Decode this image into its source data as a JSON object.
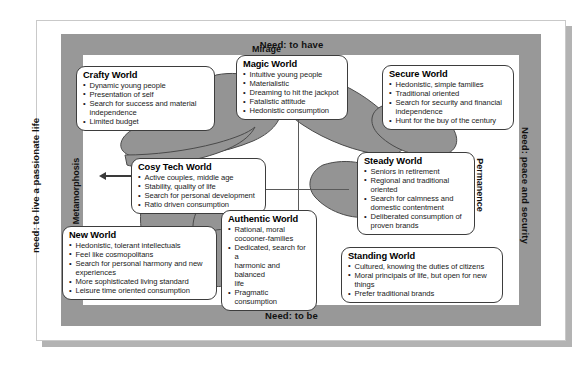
{
  "frame": {
    "need_top": "Need: to have",
    "need_bottom": "Need: to be",
    "need_left": "need: to live a passionate life",
    "need_right": "Need: peace and security"
  },
  "axes": {
    "metamorphosis": "Metamorphosis",
    "permanence": "Permanence",
    "mirage": "Mirage",
    "reality": "Reality"
  },
  "worlds": [
    {
      "id": "crafty",
      "title": "Crafty World",
      "items": [
        "Dynamic young people",
        "Presentation of self",
        "Search for success and material",
        "independence",
        "Limited budget"
      ],
      "continuations": [
        3
      ]
    },
    {
      "id": "magic",
      "title": "Magic World",
      "items": [
        "Intuitive young people",
        "Materialistic",
        "Dreaming to hit the jackpot",
        "Fatalistic attitude",
        "Hedonistic consumption"
      ],
      "continuations": []
    },
    {
      "id": "secure",
      "title": "Secure World",
      "items": [
        "Hedonistic, simple families",
        "Traditional oriented",
        "Search for security and financial",
        "independence",
        "Hunt for the buy of the century"
      ],
      "continuations": [
        3
      ]
    },
    {
      "id": "cosy",
      "title": "Cosy Tech World",
      "items": [
        "Active couples, middle age",
        "Stability, quality of life",
        "Search for personal development",
        "Ratio driven consumption"
      ],
      "continuations": []
    },
    {
      "id": "steady",
      "title": "Steady World",
      "items": [
        "Seniors in retirement",
        "Regional and traditional",
        "oriented",
        "Search for calmness and",
        "domestic contentment",
        "Deliberated consumption of",
        "proven brands"
      ],
      "continuations": [
        2,
        4,
        6
      ]
    },
    {
      "id": "new",
      "title": "New World",
      "items": [
        "Hedonistic, tolerant intellectuals",
        "Feel like cosmopolitans",
        "Search for personal harmony and new",
        "experiences",
        "More sophisticated living standard",
        "Leisure time oriented consumption"
      ],
      "continuations": [
        3
      ]
    },
    {
      "id": "authentic",
      "title": "Authentic World",
      "items": [
        "Rational, moral",
        "cocooner-families",
        "Dedicated, search for a",
        "harmonic and balanced",
        "life",
        "Pragmatic consumption"
      ],
      "continuations": [
        1,
        3,
        4
      ]
    },
    {
      "id": "standing",
      "title": "Standing World",
      "items": [
        "Cultured, knowing the duties of citizens",
        "Moral principals of life, but open for new",
        "things",
        "Prefer traditional brands"
      ],
      "continuations": [
        2
      ]
    }
  ],
  "colors": {
    "frame_grey": "#989898",
    "blob_grey": "#949494",
    "box_border": "#3d3d3d",
    "sheet_shadow": "#b3b3b3"
  }
}
